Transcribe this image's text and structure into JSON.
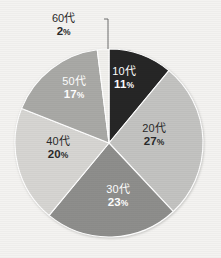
{
  "background_color": "#f4f3f1",
  "callout": {
    "category": "60代",
    "percent": "2",
    "percent_symbol": "%"
  },
  "chart_data": {
    "type": "pie",
    "title": "",
    "subtitle": "",
    "xlabel": "",
    "ylabel": "",
    "legend_position": "none",
    "labels_inside_slices": true,
    "start_angle_deg": 0,
    "direction": "clockwise",
    "units": "percent",
    "total": 100,
    "categories": [
      "10代",
      "20代",
      "30代",
      "40代",
      "50代",
      "60代"
    ],
    "values": [
      11,
      27,
      23,
      20,
      17,
      2
    ],
    "slices": [
      {
        "label": "10代",
        "value": 11,
        "percent_text": "11",
        "percent_symbol": "%",
        "color": "#262626",
        "text_color": "#ffffff",
        "label_placement": "inside",
        "label_x": 124,
        "label_y": 78
      },
      {
        "label": "20代",
        "value": 27,
        "percent_text": "27",
        "percent_symbol": "%",
        "color": "#c3c3c1",
        "text_color": "#2a2a2a",
        "label_placement": "inside",
        "label_x": 154,
        "label_y": 135
      },
      {
        "label": "30代",
        "value": 23,
        "percent_text": "23",
        "percent_symbol": "%",
        "color": "#8e8e8c",
        "text_color": "#ffffff",
        "label_placement": "inside",
        "label_x": 118,
        "label_y": 196
      },
      {
        "label": "40代",
        "value": 20,
        "percent_text": "20",
        "percent_symbol": "%",
        "color": "#d6d5d2",
        "text_color": "#2a2a2a",
        "label_placement": "inside",
        "label_x": 58,
        "label_y": 148
      },
      {
        "label": "50代",
        "value": 17,
        "percent_text": "17",
        "percent_symbol": "%",
        "color": "#a9a9a6",
        "text_color": "#ffffff",
        "label_placement": "inside",
        "label_x": 74,
        "label_y": 88
      },
      {
        "label": "60代",
        "value": 2,
        "percent_text": "2",
        "percent_symbol": "%",
        "color": "#f1f0ed",
        "text_color": "#2a2a2a",
        "label_placement": "outside-callout",
        "label_x": 78,
        "label_y": 24
      }
    ],
    "geometry": {
      "center_x": 109,
      "center_y": 143,
      "radius": 94
    },
    "leader_line": {
      "color": "#6d6d6d",
      "from_x": 104,
      "from_y": 19,
      "elbow_x": 108,
      "elbow_y": 19,
      "to_x": 108,
      "to_y": 49
    }
  }
}
